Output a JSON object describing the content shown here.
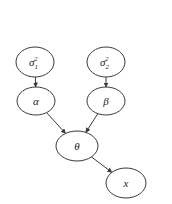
{
  "diagram": {
    "type": "directed-graph",
    "nodes": [
      {
        "id": "sigma1sq",
        "label": "σ",
        "sub": "1",
        "sup": "2"
      },
      {
        "id": "sigma2sq",
        "label": "σ",
        "sub": "2",
        "sup": "2"
      },
      {
        "id": "alpha",
        "label": "α"
      },
      {
        "id": "beta",
        "label": "β"
      },
      {
        "id": "theta",
        "label": "θ"
      },
      {
        "id": "x",
        "label": "x"
      }
    ],
    "edges": [
      {
        "from": "sigma1sq",
        "to": "alpha"
      },
      {
        "from": "sigma2sq",
        "to": "beta"
      },
      {
        "from": "alpha",
        "to": "theta"
      },
      {
        "from": "beta",
        "to": "theta"
      },
      {
        "from": "theta",
        "to": "x"
      }
    ],
    "colors": {
      "stroke": "#3a3a3a",
      "text": "#222222",
      "background": "#ffffff"
    }
  }
}
